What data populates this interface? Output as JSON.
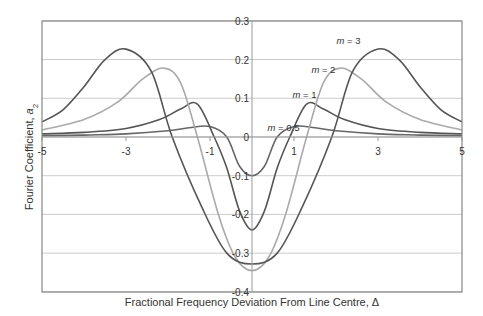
{
  "chart_data": {
    "type": "line",
    "title": "",
    "xlabel": "Fractional Frequency Deviation From Line Centre, Δ",
    "ylabel": "Fourier Coefficient, a2",
    "ylabel_parts": {
      "text": "Fourier Coefficient, ",
      "var": "a",
      "sub": "2"
    },
    "xlim": [
      -5,
      5
    ],
    "ylim": [
      -0.4,
      0.3
    ],
    "xticks": [
      -5,
      -3,
      -1,
      1,
      3,
      5
    ],
    "xtick_labels": [
      "-5",
      "-3",
      "-1",
      "1",
      "3",
      "5"
    ],
    "yticks": [
      0.3,
      0.2,
      0.1,
      0,
      -0.1,
      -0.2,
      -0.3,
      -0.4
    ],
    "ytick_labels": [
      "0.3",
      "0.2",
      "0.1",
      "0",
      "-0.1",
      "-0.2",
      "-0.3",
      "-0.4"
    ],
    "grid": "horizontal",
    "legend": "inline labels",
    "series": [
      {
        "name": "m = 0.5",
        "label_var": "m",
        "label_val": "= 0.5",
        "color": "#666666",
        "symmetric": true,
        "points": [
          [
            0,
            -0.1
          ],
          [
            0.3,
            -0.075
          ],
          [
            0.6,
            0.0
          ],
          [
            1.0,
            0.027
          ],
          [
            1.5,
            0.024
          ],
          [
            2.0,
            0.016
          ],
          [
            3.0,
            0.008
          ],
          [
            4.0,
            0.005
          ],
          [
            5.0,
            0.003
          ]
        ]
      },
      {
        "name": "m = 1",
        "label_var": "m",
        "label_val": "= 1",
        "color": "#555555",
        "symmetric": true,
        "points": [
          [
            0,
            -0.24
          ],
          [
            0.3,
            -0.19
          ],
          [
            0.6,
            -0.08
          ],
          [
            0.9,
            0.0
          ],
          [
            1.3,
            0.085
          ],
          [
            1.7,
            0.072
          ],
          [
            2.2,
            0.045
          ],
          [
            3.0,
            0.022
          ],
          [
            4.0,
            0.012
          ],
          [
            5.0,
            0.008
          ]
        ]
      },
      {
        "name": "m = 2",
        "label_var": "m",
        "label_val": "= 2",
        "color": "#aaaaaa",
        "symmetric": true,
        "points": [
          [
            0,
            -0.345
          ],
          [
            0.4,
            -0.31
          ],
          [
            0.8,
            -0.2
          ],
          [
            1.3,
            0.0
          ],
          [
            1.7,
            0.14
          ],
          [
            2.1,
            0.178
          ],
          [
            2.6,
            0.15
          ],
          [
            3.2,
            0.09
          ],
          [
            4.0,
            0.045
          ],
          [
            5.0,
            0.018
          ]
        ]
      },
      {
        "name": "m = 3",
        "label_var": "m",
        "label_val": "= 3",
        "color": "#555555",
        "symmetric": true,
        "points": [
          [
            0,
            -0.328
          ],
          [
            0.6,
            -0.3
          ],
          [
            1.2,
            -0.18
          ],
          [
            1.9,
            0.0
          ],
          [
            2.4,
            0.17
          ],
          [
            3.0,
            0.227
          ],
          [
            3.5,
            0.2
          ],
          [
            4.0,
            0.13
          ],
          [
            4.5,
            0.07
          ],
          [
            5.0,
            0.039
          ]
        ]
      }
    ],
    "annotations": [
      {
        "series": "m = 0.5",
        "text": "m = 0.5",
        "x": 0.75,
        "y": 0.015
      },
      {
        "series": "m = 1",
        "text": "m = 1",
        "x": 1.25,
        "y": 0.1
      },
      {
        "series": "m = 2",
        "text": "m = 2",
        "x": 1.7,
        "y": 0.165
      },
      {
        "series": "m = 3",
        "text": "m = 3",
        "x": 2.3,
        "y": 0.24
      }
    ]
  },
  "colors": {
    "gridline": "#cccccc",
    "axis": "#999999",
    "border": "#888888"
  }
}
